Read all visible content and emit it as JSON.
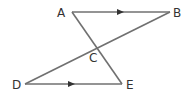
{
  "diagram": {
    "points": {
      "A": {
        "label": "A",
        "x": 72,
        "y": 12
      },
      "B": {
        "label": "B",
        "x": 170,
        "y": 12
      },
      "C": {
        "label": "C",
        "x": 98,
        "y": 49
      },
      "D": {
        "label": "D",
        "x": 25,
        "y": 84
      },
      "E": {
        "label": "E",
        "x": 122,
        "y": 84
      }
    },
    "segments": [
      "AB",
      "AE",
      "BD",
      "DE"
    ],
    "parallel_marks": [
      "AB",
      "DE"
    ],
    "line_color": "#707070"
  }
}
